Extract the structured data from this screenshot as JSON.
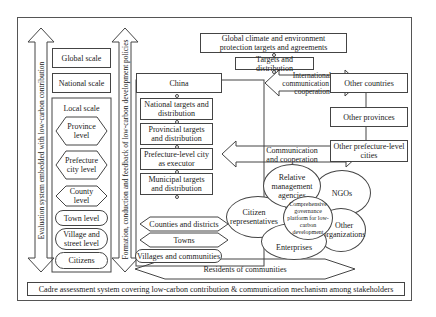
{
  "diagram": {
    "left_arrows": {
      "evaluation": "Evaluation system embedded with low-carbon contribution",
      "formation": "Formation, conduction and feedback of low-carbon development policies"
    },
    "scales": {
      "global": "Global scale",
      "national": "National scale",
      "local": "Local scale",
      "levels": [
        "Province level",
        "Prefecture city level",
        "County level",
        "Town level",
        "Village and street level",
        "Citizens"
      ]
    },
    "top": {
      "global_targets": "Global climate and environment protection targets and agreements",
      "targets_distribution": "Targets and distribution",
      "international": "International communication and cooperation"
    },
    "china_chain": {
      "china": "China",
      "national_targets": "National targets and distribution",
      "provincial_targets": "Provincial targets and distribution",
      "prefecture": "Prefecture-level city as executor",
      "municipal": "Municipal targets and distribution",
      "counties": "Counties and districts",
      "towns": "Towns",
      "villages": "Villages and communities"
    },
    "communication": "Communication and cooperation",
    "others": {
      "countries": "Other countries",
      "provinces": "Other provinces",
      "prefecture_cities": "Other prefecture-level cities"
    },
    "stakeholders": {
      "relative": "Relative management agencies",
      "ngos": "NGOs",
      "citizen_reps": "Citizen representatives",
      "platform": "Comprehensive governance platform for low-carbon development",
      "other_orgs": "Other organizations",
      "enterprises": "Enterprises"
    },
    "residents": "Residents of communities",
    "bottom": "Cadre assessment system covering low-carbon contribution & communication mechanism among stakeholders"
  },
  "colors": {
    "line": "#444444",
    "background": "#ffffff",
    "text": "#222222"
  }
}
